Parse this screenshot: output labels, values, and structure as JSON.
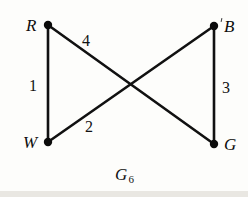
{
  "figure": {
    "caption_symbol": "G",
    "caption_subscript": "6",
    "background_color": "#fdfdfb",
    "ink_color": "#111111"
  },
  "graph": {
    "vertices": [
      {
        "id": "R",
        "label": "R",
        "x": 48,
        "y": 25,
        "label_x": 26,
        "label_y": 17,
        "dot_radius": 4.2
      },
      {
        "id": "B",
        "label": "B",
        "x": 214,
        "y": 26,
        "label_x": 224,
        "label_y": 18,
        "dot_radius": 4.2
      },
      {
        "id": "W",
        "label": "W",
        "x": 48,
        "y": 142,
        "label_x": 23,
        "label_y": 134,
        "dot_radius": 4.2
      },
      {
        "id": "G",
        "label": "G",
        "x": 214,
        "y": 144,
        "label_x": 224,
        "label_y": 136,
        "dot_radius": 4.2
      }
    ],
    "edges": [
      {
        "id": "RW",
        "from": "R",
        "to": "W",
        "weight": "1",
        "label_x": 29,
        "label_y": 78,
        "stroke_width": 2.6
      },
      {
        "id": "RG",
        "from": "R",
        "to": "G",
        "weight": "4",
        "label_x": 82,
        "label_y": 33,
        "stroke_width": 2.6
      },
      {
        "id": "WB",
        "from": "W",
        "to": "B",
        "weight": "2",
        "label_x": 85,
        "label_y": 119,
        "stroke_width": 2.6
      },
      {
        "id": "BG",
        "from": "B",
        "to": "G",
        "weight": "3",
        "label_x": 222,
        "label_y": 80,
        "stroke_width": 2.6
      }
    ],
    "crossing_point": {
      "x": 132,
      "y": 85
    }
  }
}
